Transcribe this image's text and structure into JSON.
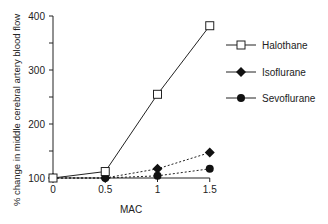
{
  "chart_data": {
    "type": "line",
    "title": "",
    "xlabel": "MAC",
    "ylabel": "% change in middle cerebral artery blood flow",
    "x": [
      0,
      0.5,
      1,
      1.5
    ],
    "x_tick_labels": [
      "0",
      "0.5",
      "1",
      "1.5"
    ],
    "y_tick_labels": [
      "100",
      "200",
      "300",
      "400"
    ],
    "ylim": [
      100,
      400
    ],
    "grid": false,
    "legend_position": "upper right",
    "series": [
      {
        "name": "Halothane",
        "marker": "open-square",
        "line": "solid",
        "values": [
          100,
          112,
          255,
          382
        ]
      },
      {
        "name": "Isoflurane",
        "marker": "filled-diamond",
        "line": "dotted",
        "values": [
          100,
          100,
          117,
          147
        ]
      },
      {
        "name": "Sevoflurane",
        "marker": "filled-circle",
        "line": "dotted",
        "values": [
          100,
          100,
          104,
          117
        ]
      }
    ]
  }
}
